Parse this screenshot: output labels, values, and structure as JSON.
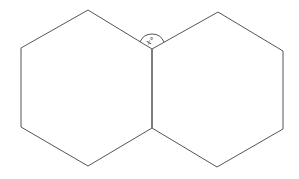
{
  "diagram": {
    "stroke_color": "#555555",
    "background": "#ffffff",
    "angle_label": "x°",
    "left_hexagon": {
      "points": "88,10 152,49 152,128 88,166 21,127 21,48"
    },
    "right_hexagon": {
      "points": "152,49 218,12 283,51 283,129 217,167 152,128"
    },
    "angle_arc": {
      "path": "M140,42 A13,13 0 0 1 164,42"
    }
  }
}
